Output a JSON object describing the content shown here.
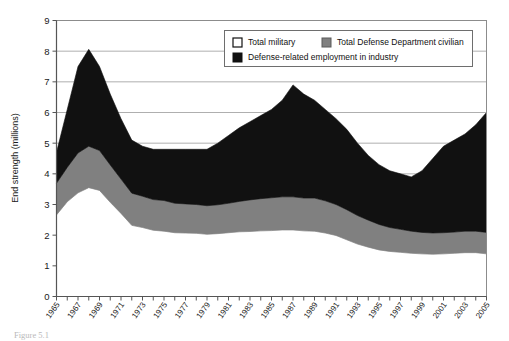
{
  "figure": {
    "caption": "Figure 5.1"
  },
  "chart_data": {
    "type": "area",
    "stacked": true,
    "title": "",
    "xlabel": "",
    "ylabel": "End strength (millions)",
    "ylim": [
      0,
      9
    ],
    "yticks": [
      0,
      1,
      2,
      3,
      4,
      5,
      6,
      7,
      8,
      9
    ],
    "ytick_labels": [
      "0",
      "1",
      "2",
      "3",
      "4",
      "5",
      "6",
      "7",
      "8",
      "9"
    ],
    "grid": "horizontal",
    "legend_position": "top-right",
    "x": [
      1965,
      1966,
      1967,
      1968,
      1969,
      1970,
      1971,
      1972,
      1973,
      1974,
      1975,
      1976,
      1977,
      1978,
      1979,
      1980,
      1981,
      1982,
      1983,
      1984,
      1985,
      1986,
      1987,
      1988,
      1989,
      1990,
      1991,
      1992,
      1993,
      1994,
      1995,
      1996,
      1997,
      1998,
      1999,
      2000,
      2001,
      2002,
      2003,
      2004,
      2005
    ],
    "xtick_labels": [
      "1965",
      "1967",
      "1969",
      "1971",
      "1973",
      "1975",
      "1977",
      "1979",
      "1981",
      "1983",
      "1985",
      "1987",
      "1989",
      "1991",
      "1993",
      "1995",
      "1997",
      "1999",
      "2001",
      "2003",
      "2005"
    ],
    "series": [
      {
        "name": "Total military",
        "color": "#ffffff",
        "values": [
          2.66,
          3.09,
          3.38,
          3.55,
          3.46,
          3.07,
          2.71,
          2.32,
          2.25,
          2.16,
          2.13,
          2.08,
          2.07,
          2.06,
          2.03,
          2.05,
          2.08,
          2.11,
          2.12,
          2.14,
          2.15,
          2.17,
          2.17,
          2.14,
          2.13,
          2.07,
          1.99,
          1.85,
          1.71,
          1.61,
          1.52,
          1.47,
          1.44,
          1.41,
          1.39,
          1.38,
          1.39,
          1.41,
          1.43,
          1.43,
          1.39
        ]
      },
      {
        "name": "Total Defense Department civilian",
        "color": "#808080",
        "values": [
          1.03,
          1.12,
          1.3,
          1.35,
          1.3,
          1.22,
          1.12,
          1.05,
          1.02,
          1.0,
          1.0,
          0.96,
          0.95,
          0.94,
          0.93,
          0.94,
          0.96,
          0.99,
          1.03,
          1.05,
          1.07,
          1.08,
          1.08,
          1.07,
          1.08,
          1.05,
          1.01,
          0.98,
          0.93,
          0.88,
          0.83,
          0.78,
          0.75,
          0.72,
          0.7,
          0.69,
          0.69,
          0.69,
          0.7,
          0.7,
          0.7
        ]
      },
      {
        "name": "Defense-related employment in industry",
        "color": "#111111",
        "values": [
          1.01,
          1.89,
          2.82,
          3.16,
          2.74,
          2.31,
          1.97,
          1.73,
          1.63,
          1.64,
          1.67,
          1.76,
          1.78,
          1.8,
          1.84,
          2.01,
          2.21,
          2.4,
          2.55,
          2.71,
          2.88,
          3.15,
          3.65,
          3.39,
          3.19,
          2.98,
          2.8,
          2.62,
          2.36,
          2.11,
          1.95,
          1.85,
          1.81,
          1.77,
          2.01,
          2.43,
          2.82,
          3.0,
          3.17,
          3.47,
          3.91
        ]
      }
    ],
    "totals": [
      4.7,
      6.1,
      7.5,
      8.06,
      7.5,
      6.6,
      5.8,
      5.1,
      4.9,
      4.8,
      4.8,
      4.8,
      4.8,
      4.8,
      4.8,
      5.0,
      5.25,
      5.5,
      5.7,
      5.9,
      6.1,
      6.4,
      6.9,
      6.6,
      6.4,
      6.1,
      5.8,
      5.45,
      5.0,
      4.6,
      4.3,
      4.1,
      4.0,
      3.9,
      4.1,
      4.5,
      4.9,
      5.1,
      5.3,
      5.6,
      6.0
    ]
  },
  "legend": {
    "items": [
      {
        "label": "Total military",
        "color": "#ffffff"
      },
      {
        "label": "Total Defense Department civilian",
        "color": "#808080"
      },
      {
        "label": "Defense-related employment in industry",
        "color": "#111111"
      }
    ]
  }
}
